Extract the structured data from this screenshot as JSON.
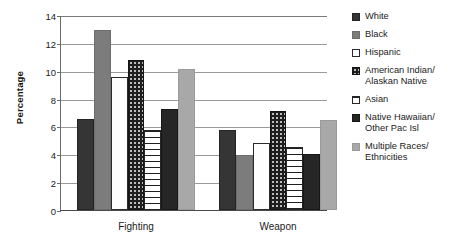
{
  "chart_data": {
    "type": "bar",
    "title": "",
    "xlabel": "",
    "ylabel": "Percentage",
    "ylim": [
      0,
      14
    ],
    "yticks": [
      0,
      2,
      4,
      6,
      8,
      10,
      12,
      14
    ],
    "grid": true,
    "legend_position": "right",
    "categories": [
      "Fighting",
      "Weapon"
    ],
    "series": [
      {
        "name": "White",
        "values": [
          6.4,
          5.6
        ],
        "swatch": "dark-solid",
        "color": "#353535"
      },
      {
        "name": "Black",
        "values": [
          12.8,
          3.8
        ],
        "swatch": "gray-solid",
        "color": "#7c7c7c"
      },
      {
        "name": "Hispanic",
        "values": [
          9.4,
          4.7
        ],
        "swatch": "white-dotted",
        "color": "#fdfdfd"
      },
      {
        "name": "American Indian/ Alaskan Native",
        "values": [
          10.6,
          7.0
        ],
        "swatch": "black-dotted",
        "color": "#1e1e1e"
      },
      {
        "name": "Asian",
        "values": [
          5.6,
          4.4
        ],
        "swatch": "white-dashed",
        "color": "#ffffff"
      },
      {
        "name": "Native Hawaiian/ Other Pac Isl",
        "values": [
          7.1,
          3.9
        ],
        "swatch": "black-solid",
        "color": "#262626"
      },
      {
        "name": "Multiple Races/ Ethnicities",
        "values": [
          10.0,
          6.3
        ],
        "swatch": "light-gray-solid",
        "color": "#a8a8a8"
      }
    ]
  },
  "legend": {
    "items": [
      {
        "line1": "White",
        "line2": ""
      },
      {
        "line1": "Black",
        "line2": ""
      },
      {
        "line1": "Hispanic",
        "line2": ""
      },
      {
        "line1": "American Indian/",
        "line2": "Alaskan Native"
      },
      {
        "line1": "Asian",
        "line2": ""
      },
      {
        "line1": "Native Hawaiian/",
        "line2": "Other Pac Isl"
      },
      {
        "line1": "Multiple Races/",
        "line2": "Ethnicities"
      }
    ]
  }
}
